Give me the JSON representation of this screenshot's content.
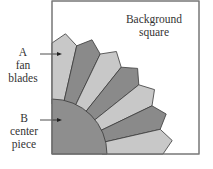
{
  "diagram": {
    "labels": {
      "background": [
        "Background",
        "square"
      ],
      "fan_blades": [
        "A",
        "fan",
        "blades"
      ],
      "center_piece": [
        "B",
        "center",
        "piece"
      ]
    },
    "colors": {
      "light_blade": "#c8c8c8",
      "dark_blade": "#8a8a8a",
      "center": "#8e8e8e",
      "outline": "#3a3a3a",
      "square_border": "#666666",
      "background": "#ffffff"
    },
    "blade_count": 7,
    "blade_pattern": [
      "light",
      "dark",
      "light",
      "dark",
      "light",
      "dark",
      "light"
    ]
  }
}
